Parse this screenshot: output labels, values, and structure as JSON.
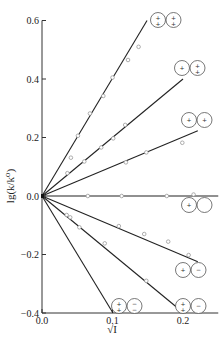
{
  "chart_data": {
    "type": "line",
    "title": "",
    "xlabel": "√I",
    "ylabel": "lg(k/k⁰)",
    "xlim": [
      0.0,
      0.25
    ],
    "ylim": [
      -0.4,
      0.6
    ],
    "x_ticks": [
      "0.0",
      "0.1",
      "0.2"
    ],
    "y_ticks": [
      "0.6",
      "0.4",
      "0.2",
      "0.0",
      "-0.2",
      "-0.4"
    ],
    "grid": false,
    "legend_position": "inline labels at line ends",
    "series": [
      {
        "name": "2+ / 2+",
        "charges": [
          2,
          2
        ],
        "slope": 4.0,
        "line": [
          [
            0.0,
            0.0
          ],
          [
            0.149,
            0.6
          ]
        ],
        "points": [
          [
            0.051,
            0.206
          ],
          [
            0.068,
            0.282
          ],
          [
            0.087,
            0.342
          ],
          [
            0.1,
            0.405
          ],
          [
            0.122,
            0.465
          ],
          [
            0.137,
            0.51
          ]
        ]
      },
      {
        "name": "1+ / 2+",
        "charges": [
          1,
          2
        ],
        "slope": 2.0,
        "line": [
          [
            0.0,
            0.0
          ],
          [
            0.2,
            0.4
          ]
        ],
        "points": [
          [
            0.036,
            0.078
          ],
          [
            0.06,
            0.118
          ],
          [
            0.084,
            0.166
          ],
          [
            0.101,
            0.197
          ],
          [
            0.118,
            0.243
          ]
        ]
      },
      {
        "name": "1+ / 1+",
        "charges": [
          1,
          1
        ],
        "slope": 1.0,
        "line": [
          [
            0.0,
            0.0
          ],
          [
            0.221,
            0.223
          ]
        ],
        "points": [
          [
            0.041,
            0.131
          ],
          [
            0.119,
            0.115
          ],
          [
            0.148,
            0.149
          ],
          [
            0.199,
            0.182
          ]
        ]
      },
      {
        "name": "1+ / 0",
        "charges": [
          1,
          0
        ],
        "slope": 0.0,
        "line": [
          [
            0.0,
            0.0
          ],
          [
            0.25,
            0.0
          ]
        ],
        "points": [
          [
            0.065,
            0.0
          ],
          [
            0.113,
            0.0
          ],
          [
            0.177,
            0.0
          ],
          [
            0.215,
            0.005
          ]
        ]
      },
      {
        "name": "1+ / 1-",
        "charges": [
          1,
          -1
        ],
        "slope": -1.0,
        "line": [
          [
            0.0,
            0.0
          ],
          [
            0.221,
            -0.225
          ]
        ],
        "points": [
          [
            0.109,
            -0.103
          ],
          [
            0.145,
            -0.13
          ],
          [
            0.179,
            -0.156
          ],
          [
            0.208,
            -0.202
          ]
        ]
      },
      {
        "name": "2+ / 1-",
        "charges": [
          2,
          -1
        ],
        "slope": -2.0,
        "line": [
          [
            0.0,
            0.0
          ],
          [
            0.201,
            -0.4
          ]
        ],
        "points": [
          [
            0.035,
            -0.065
          ],
          [
            0.04,
            -0.073
          ],
          [
            0.053,
            -0.107
          ],
          [
            0.089,
            -0.162
          ],
          [
            0.148,
            -0.29
          ]
        ]
      },
      {
        "name": "2+ / 2-",
        "charges": [
          2,
          -2
        ],
        "slope": -4.0,
        "line": [
          [
            0.0,
            0.0
          ],
          [
            0.1007,
            -0.4
          ]
        ],
        "points": []
      }
    ]
  },
  "labels": {
    "x_axis_title": "√I",
    "y_axis_title": "lg(k/k⁰)",
    "ion_labels": [
      {
        "series": "2+ / 2+",
        "left": "2+",
        "right": "2+"
      },
      {
        "series": "1+ / 2+",
        "left": "1+",
        "right": "2+"
      },
      {
        "series": "1+ / 1+",
        "left": "1+",
        "right": "1+"
      },
      {
        "series": "1+ / 0",
        "left": "1+",
        "right": "0"
      },
      {
        "series": "1+ / 1-",
        "left": "1+",
        "right": "1-"
      },
      {
        "series": "2+ / 1-",
        "left": "2+",
        "right": "1-"
      },
      {
        "series": "2+ / 2-",
        "left": "2+",
        "right": "2-"
      }
    ]
  }
}
